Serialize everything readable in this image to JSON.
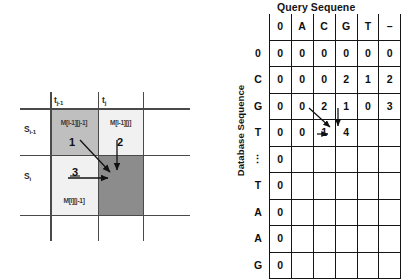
{
  "left_diagram": {
    "name": "dp-recurrence-cell-diagram",
    "column_headers": [
      {
        "id": "t-prev",
        "base": "t",
        "sub": "j-1"
      },
      {
        "id": "t-cur",
        "base": "t",
        "sub": "j"
      }
    ],
    "row_headers": [
      {
        "id": "s-prev",
        "base": "S",
        "sub": "i-1"
      },
      {
        "id": "s-cur",
        "base": "S",
        "sub": "i"
      }
    ],
    "cells": [
      {
        "id": "m-i1-j1",
        "label": "M[i-1][j-1]",
        "shade": "#bfbfbf"
      },
      {
        "id": "m-i1-j",
        "label": "M[i-1][j]",
        "shade": "#f0f0f0"
      },
      {
        "id": "m-i-j1",
        "label": "M[i][j-1]",
        "shade": "#f0f0f0"
      },
      {
        "id": "m-i-j",
        "label": "",
        "shade": "#8c8c8c"
      }
    ],
    "arrow_numbers": [
      {
        "id": "arrow-1",
        "label": "1",
        "direction": "diagonal"
      },
      {
        "id": "arrow-2",
        "label": "2",
        "direction": "vertical"
      },
      {
        "id": "arrow-3",
        "label": "3",
        "direction": "horizontal"
      }
    ]
  },
  "right_table": {
    "name": "alignment-score-matrix",
    "title": "Query Sequene",
    "side_label": "Database Sequence",
    "column_headers": [
      "",
      "0",
      "A",
      "C",
      "G",
      "T",
      "–"
    ],
    "rows": [
      {
        "header": "0",
        "values": [
          "0",
          "0",
          "0",
          "0",
          "0",
          "0"
        ]
      },
      {
        "header": "C",
        "values": [
          "0",
          "0",
          "0",
          "2",
          "1",
          "2"
        ]
      },
      {
        "header": "G",
        "values": [
          "0",
          "0",
          "2",
          "1",
          "0",
          "3"
        ]
      },
      {
        "header": "T",
        "values": [
          "0",
          "0",
          "1",
          "4",
          "",
          ""
        ]
      },
      {
        "header": "⋮",
        "values": [
          "0",
          "",
          "",
          "",
          "",
          ""
        ]
      },
      {
        "header": "T",
        "values": [
          "0",
          "",
          "",
          "",
          "",
          ""
        ]
      },
      {
        "header": "A",
        "values": [
          "0",
          "",
          "",
          "",
          "",
          ""
        ]
      },
      {
        "header": "A",
        "values": [
          "0",
          "",
          "",
          "",
          "",
          ""
        ]
      },
      {
        "header": "G",
        "values": [
          "0",
          "",
          "",
          "",
          "",
          ""
        ]
      }
    ],
    "arrows": [
      {
        "id": "matrix-arrow-diagonal",
        "from": "G-C-cell",
        "to": "T-G-cell"
      },
      {
        "id": "matrix-arrow-vertical",
        "from": "G-G-cell",
        "to": "T-G-cell"
      },
      {
        "id": "matrix-arrow-horizontal",
        "from": "T-C-cell",
        "to": "T-G-cell"
      }
    ]
  },
  "colors": {
    "grid_line": "#4a4a4a",
    "table_line": "#151515",
    "cell_dark": "#8c8c8c",
    "cell_medium": "#bfbfbf",
    "cell_light": "#f0f0f0",
    "text": "#111111"
  }
}
